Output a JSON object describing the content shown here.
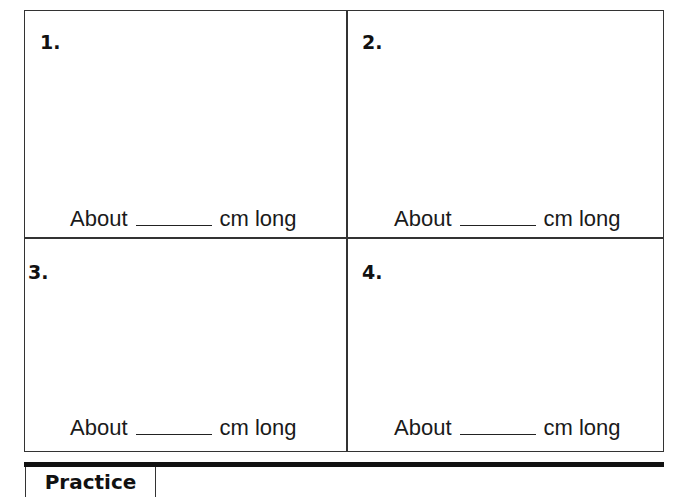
{
  "worksheet": {
    "problems": [
      {
        "number": "1.",
        "prefix": "About",
        "unit": "cm long"
      },
      {
        "number": "2.",
        "prefix": "About",
        "unit": "cm long"
      },
      {
        "number": "3.",
        "prefix": "About",
        "unit": "cm long"
      },
      {
        "number": "4.",
        "prefix": "About",
        "unit": "cm long"
      }
    ]
  },
  "footer": {
    "tab_label": "Practice"
  }
}
